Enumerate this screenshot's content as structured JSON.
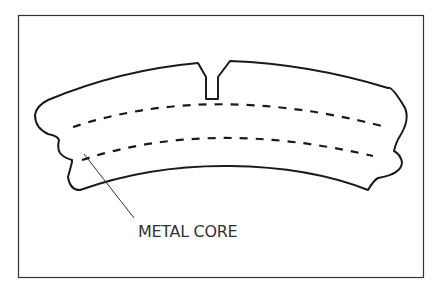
{
  "diagram": {
    "labels": {
      "metal_core": "METAL CORE"
    },
    "colors": {
      "stroke": "#1a1a1a",
      "frame": "#333333",
      "background": "#ffffff"
    }
  }
}
